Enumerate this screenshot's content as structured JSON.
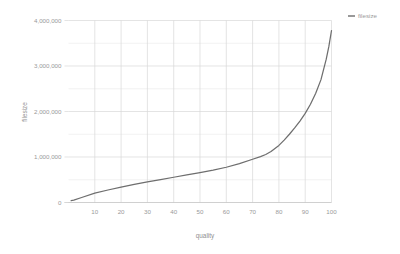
{
  "chart_data": {
    "type": "line",
    "title": "",
    "xlabel": "quality",
    "ylabel": "filesize",
    "xlim": [
      0,
      100
    ],
    "ylim": [
      0,
      4000000
    ],
    "grid": true,
    "legend_position": "top-right",
    "x_ticks": [
      10,
      20,
      30,
      40,
      50,
      60,
      70,
      80,
      90,
      100
    ],
    "x_tick_labels": [
      "10",
      "20",
      "30",
      "40",
      "50",
      "60",
      "70",
      "80",
      "90",
      "100"
    ],
    "y_ticks": [
      0,
      1000000,
      2000000,
      3000000,
      4000000
    ],
    "y_tick_labels": [
      "0",
      "1,000,000",
      "2,000,000",
      "3,000,000",
      "4,000,000"
    ],
    "y_minor_ticks": [
      500000,
      1500000,
      2500000,
      3500000
    ],
    "series": [
      {
        "name": "filesize",
        "color": "#6e6e6e",
        "x": [
          1,
          2,
          5,
          10,
          15,
          20,
          25,
          30,
          35,
          40,
          45,
          50,
          55,
          60,
          65,
          70,
          73,
          75,
          77,
          80,
          82,
          84,
          86,
          88,
          90,
          92,
          94,
          96,
          98,
          99,
          100
        ],
        "y": [
          42000,
          52000,
          110000,
          205000,
          275000,
          340000,
          400000,
          455000,
          505000,
          555000,
          605000,
          655000,
          710000,
          775000,
          855000,
          950000,
          1010000,
          1055000,
          1120000,
          1255000,
          1370000,
          1500000,
          1640000,
          1790000,
          1960000,
          2160000,
          2400000,
          2700000,
          3150000,
          3430000,
          3780000
        ]
      }
    ]
  },
  "legend": {
    "entries": [
      {
        "label": "filesize",
        "color": "#6e6e6e"
      }
    ]
  },
  "axes": {
    "x_title": "quality",
    "y_title": "filesize"
  }
}
